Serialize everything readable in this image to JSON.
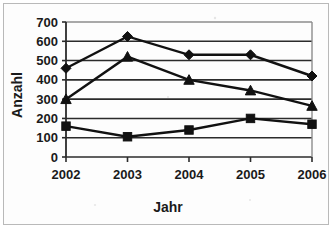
{
  "chart_data": {
    "type": "line",
    "title": "",
    "subtitle": "",
    "xlabel": "Jahr",
    "ylabel": "Anzahl",
    "categories": [
      "2002",
      "2003",
      "2004",
      "2005",
      "2006"
    ],
    "x": [
      2002,
      2003,
      2004,
      2005,
      2006
    ],
    "xlim": [
      2002,
      2006
    ],
    "ylim": [
      0,
      700
    ],
    "yticks": [
      0,
      100,
      200,
      300,
      400,
      500,
      600,
      700
    ],
    "ytick_labels": [
      "0",
      "100",
      "200",
      "300",
      "400",
      "500",
      "600",
      "700"
    ],
    "xtick_labels": [
      "2002",
      "2003",
      "2004",
      "2005",
      "2006"
    ],
    "grid": true,
    "grid_axis": "y",
    "legend": false,
    "legend_position": "none",
    "series": [
      {
        "name": "series-diamond",
        "marker": "diamond",
        "color": "#111111",
        "values": [
          460,
          625,
          530,
          530,
          420
        ]
      },
      {
        "name": "series-triangle",
        "marker": "triangle",
        "color": "#111111",
        "values": [
          300,
          520,
          400,
          345,
          265
        ]
      },
      {
        "name": "series-square",
        "marker": "square",
        "color": "#111111",
        "values": [
          160,
          105,
          140,
          200,
          170
        ]
      }
    ]
  },
  "axes": {
    "y_axis_title": "Anzahl",
    "x_axis_title": "Jahr"
  },
  "colors": {
    "ink": "#111111",
    "gridline": "#2b2b2b",
    "frame": "#b9b9b9",
    "background": "#ffffff"
  }
}
